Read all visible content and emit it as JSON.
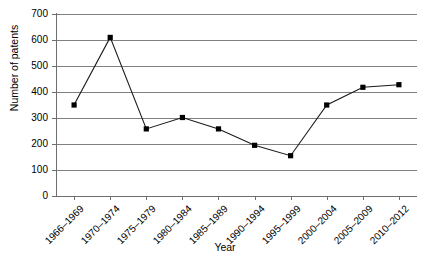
{
  "chart_data": {
    "type": "line",
    "title": "",
    "xlabel": "Year",
    "ylabel": "Number of patents",
    "categories": [
      "1966–1969",
      "1970–1974",
      "1975–1979",
      "1980–1984",
      "1985–1989",
      "1990–1994",
      "1995–1999",
      "2000–2004",
      "2005–2009",
      "2010–2012"
    ],
    "series": [
      {
        "name": "Number of patents",
        "values": [
          350,
          610,
          258,
          302,
          258,
          195,
          155,
          350,
          418,
          428
        ]
      }
    ],
    "values": [
      350,
      610,
      258,
      302,
      258,
      195,
      155,
      350,
      418,
      428
    ],
    "ylim": [
      0,
      700
    ],
    "ytick_labels": [
      "700",
      "600",
      "500",
      "400",
      "300",
      "200",
      "100",
      "0"
    ],
    "ytick_values": [
      700,
      600,
      500,
      400,
      300,
      200,
      100,
      0
    ],
    "grid": "horizontal",
    "legend": "none",
    "marker": "square",
    "line_color": "#1a1a1a",
    "grid_color": "#808080"
  }
}
